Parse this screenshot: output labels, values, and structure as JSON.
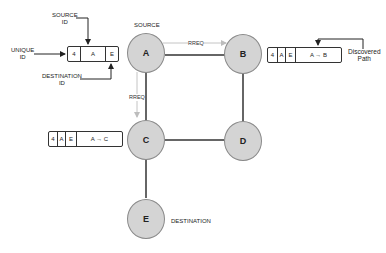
{
  "diagram": {
    "nodes": [
      {
        "id": "A",
        "label": "A"
      },
      {
        "id": "B",
        "label": "B"
      },
      {
        "id": "C",
        "label": "C"
      },
      {
        "id": "D",
        "label": "D"
      },
      {
        "id": "E",
        "label": "E"
      }
    ],
    "edges": [
      {
        "from": "A",
        "to": "B"
      },
      {
        "from": "A",
        "to": "C"
      },
      {
        "from": "B",
        "to": "D"
      },
      {
        "from": "C",
        "to": "D"
      },
      {
        "from": "C",
        "to": "E"
      }
    ],
    "rreq_arrows": [
      {
        "from": "A",
        "to": "B",
        "label": "RREQ"
      },
      {
        "from": "A",
        "to": "C",
        "label": "RREQ"
      }
    ],
    "labels": {
      "source": "SOURCE",
      "destination": "DESTINATION",
      "rreq_ab": "RREQ",
      "rreq_ac": "RREQ"
    },
    "legend": {
      "source_id_line1": "SOURCE",
      "source_id_line2": "ID",
      "unique_id_line1": "UNIQUE",
      "unique_id_line2": "ID",
      "destination_id_line1": "DESTINATION",
      "destination_id_line2": "ID",
      "discovered_path_line1": "Discovered",
      "discovered_path_line2": "Path"
    },
    "packets": {
      "header": {
        "unique_id": "4",
        "source": "A",
        "destination": "E"
      },
      "at_b": {
        "unique_id": "4",
        "source": "A",
        "destination": "E",
        "path": "A → B"
      },
      "at_c": {
        "unique_id": "4",
        "source": "A",
        "destination": "E",
        "path": "A → C"
      }
    }
  }
}
